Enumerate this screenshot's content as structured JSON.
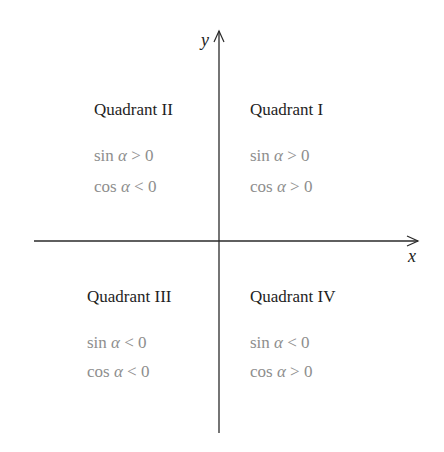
{
  "axes": {
    "x_label": "x",
    "y_label": "y"
  },
  "quadrants": [
    {
      "id": "I",
      "title": "Quadrant I",
      "sin": {
        "fn": "sin",
        "var": "α",
        "rel": "> 0"
      },
      "cos": {
        "fn": "cos",
        "var": "α",
        "rel": "> 0"
      }
    },
    {
      "id": "II",
      "title": "Quadrant II",
      "sin": {
        "fn": "sin",
        "var": "α",
        "rel": "> 0"
      },
      "cos": {
        "fn": "cos",
        "var": "α",
        "rel": "< 0"
      }
    },
    {
      "id": "III",
      "title": "Quadrant III",
      "sin": {
        "fn": "sin",
        "var": "α",
        "rel": "< 0"
      },
      "cos": {
        "fn": "cos",
        "var": "α",
        "rel": "< 0"
      }
    },
    {
      "id": "IV",
      "title": "Quadrant IV",
      "sin": {
        "fn": "sin",
        "var": "α",
        "rel": "< 0"
      },
      "cos": {
        "fn": "cos",
        "var": "α",
        "rel": "> 0"
      }
    }
  ],
  "colors": {
    "axis": "#222222",
    "title": "#1e1e1e",
    "expression": "#8e8e8e"
  }
}
